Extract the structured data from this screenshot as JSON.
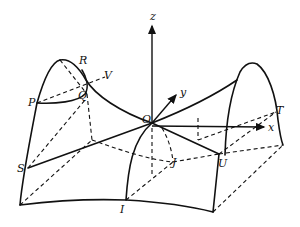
{
  "figure": {
    "type": "saddle-surface-diagram",
    "stroke_color": "#111111",
    "background": "#ffffff"
  },
  "axes": {
    "x_label": "x",
    "y_label": "y",
    "z_label": "z",
    "origin_label": "O"
  },
  "points": {
    "P": "P",
    "Q": "Q",
    "R": "R",
    "V": "V",
    "S": "S",
    "T": "T",
    "U": "U",
    "I": "I",
    "J": "J"
  }
}
